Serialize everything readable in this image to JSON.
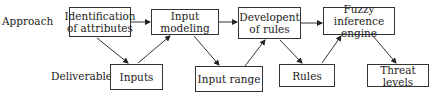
{
  "row_labels": {
    "approach": "Approach",
    "deliverables": "Deliverables"
  },
  "approach_steps": [
    {
      "line1": "Identification",
      "line2": "of attributes"
    },
    {
      "line1": "Input",
      "line2": "modeling"
    },
    {
      "line1": "Developent",
      "line2": "of rules"
    },
    {
      "line1": "Fuzzy inference",
      "line2": "engine"
    }
  ],
  "deliverables": [
    "Inputs",
    "Input range",
    "Rules",
    "Threat levels"
  ]
}
